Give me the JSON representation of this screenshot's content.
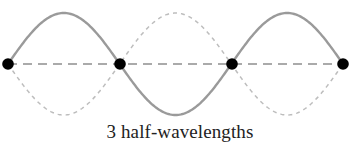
{
  "diagram": {
    "type": "standing-wave",
    "caption": "3 half-wavelengths",
    "half_wavelengths": 3,
    "axis_y": 64,
    "amplitude": 51,
    "nodes": [
      {
        "x": 8,
        "y": 64
      },
      {
        "x": 120,
        "y": 64
      },
      {
        "x": 232,
        "y": 64
      },
      {
        "x": 343,
        "y": 64
      }
    ],
    "colors": {
      "solid_wave": "#9a9a9a",
      "dashed_wave": "#bdbdbd",
      "axis_line": "#8f8f8f",
      "node": "#000000",
      "caption": "#222222"
    }
  }
}
